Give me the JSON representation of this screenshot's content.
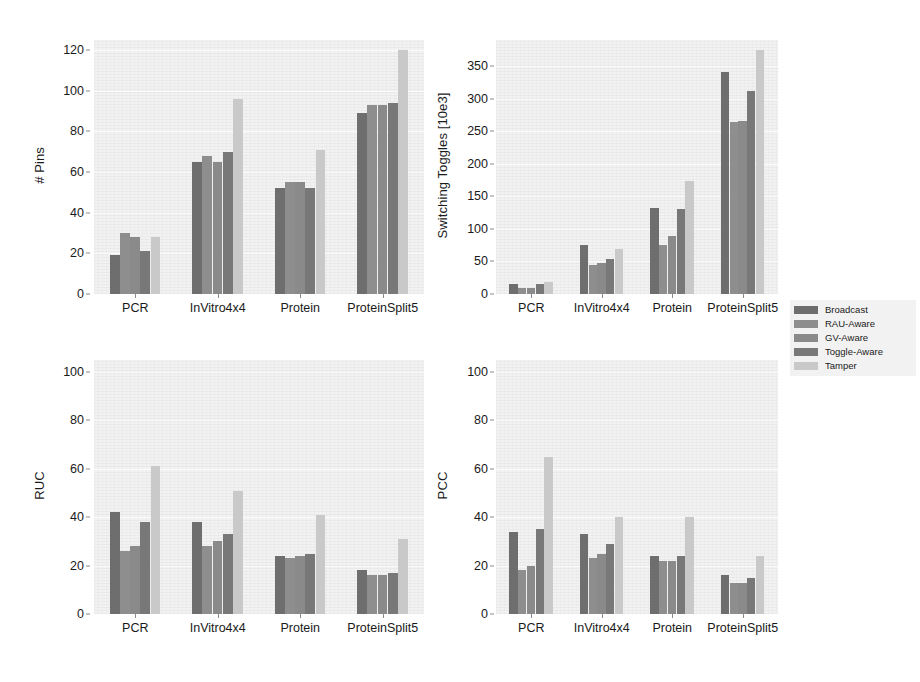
{
  "figure": {
    "background": "#ffffff",
    "plot_background": "#f2f2f2",
    "grid": true,
    "legend_position": "right-middle"
  },
  "series_colors": {
    "Broadcast": "#6e6e6e",
    "RAU-Aware": "#8e8e8e",
    "GV-Aware": "#8a8a8a",
    "Toggle-Aware": "#787878",
    "Tamper": "#c9c9c9"
  },
  "legend": {
    "entries": [
      {
        "label": "Broadcast",
        "color": "#6e6e6e"
      },
      {
        "label": "RAU-Aware",
        "color": "#8e8e8e"
      },
      {
        "label": "GV-Aware",
        "color": "#8a8a8a"
      },
      {
        "label": "Toggle-Aware",
        "color": "#787878"
      },
      {
        "label": "Tamper",
        "color": "#c9c9c9"
      }
    ]
  },
  "chart_data": [
    {
      "type": "bar",
      "title": "",
      "xlabel": "",
      "ylabel": "# Pins",
      "categories": [
        "PCR",
        "InVitro4x4",
        "Protein",
        "ProteinSplit5"
      ],
      "yticks": [
        0,
        20,
        40,
        60,
        80,
        100,
        120
      ],
      "ylim": [
        0,
        125
      ],
      "grid": true,
      "series": [
        {
          "name": "Broadcast",
          "values": [
            19,
            65,
            52,
            89
          ]
        },
        {
          "name": "RAU-Aware",
          "values": [
            30,
            68,
            55,
            93
          ]
        },
        {
          "name": "GV-Aware",
          "values": [
            28,
            65,
            55,
            93
          ]
        },
        {
          "name": "Toggle-Aware",
          "values": [
            21,
            70,
            52,
            94
          ]
        },
        {
          "name": "Tamper",
          "values": [
            28,
            96,
            71,
            120
          ]
        }
      ]
    },
    {
      "type": "bar",
      "title": "",
      "xlabel": "",
      "ylabel": "Switching Toggles [10e3]",
      "categories": [
        "PCR",
        "InVitro4x4",
        "Protein",
        "ProteinSplit5"
      ],
      "yticks": [
        0,
        50,
        100,
        150,
        200,
        250,
        300,
        350
      ],
      "ylim": [
        0,
        390
      ],
      "grid": true,
      "series": [
        {
          "name": "Broadcast",
          "values": [
            15,
            75,
            132,
            341
          ]
        },
        {
          "name": "RAU-Aware",
          "values": [
            9,
            45,
            75,
            264
          ]
        },
        {
          "name": "GV-Aware",
          "values": [
            10,
            48,
            89,
            265
          ]
        },
        {
          "name": "Toggle-Aware",
          "values": [
            15,
            54,
            131,
            311
          ]
        },
        {
          "name": "Tamper",
          "values": [
            18,
            69,
            173,
            374
          ]
        }
      ]
    },
    {
      "type": "bar",
      "title": "",
      "xlabel": "",
      "ylabel": "RUC",
      "categories": [
        "PCR",
        "InVitro4x4",
        "Protein",
        "ProteinSplit5"
      ],
      "yticks": [
        0,
        20,
        40,
        60,
        80,
        100
      ],
      "ylim": [
        0,
        105
      ],
      "grid": true,
      "series": [
        {
          "name": "Broadcast",
          "values": [
            42,
            38,
            24,
            18
          ]
        },
        {
          "name": "RAU-Aware",
          "values": [
            26,
            28,
            23,
            16
          ]
        },
        {
          "name": "GV-Aware",
          "values": [
            28,
            30,
            24,
            16
          ]
        },
        {
          "name": "Toggle-Aware",
          "values": [
            38,
            33,
            25,
            17
          ]
        },
        {
          "name": "Tamper",
          "values": [
            61,
            51,
            41,
            31
          ]
        }
      ]
    },
    {
      "type": "bar",
      "title": "",
      "xlabel": "",
      "ylabel": "PCC",
      "categories": [
        "PCR",
        "InVitro4x4",
        "Protein",
        "ProteinSplit5"
      ],
      "yticks": [
        0,
        20,
        40,
        60,
        80,
        100
      ],
      "ylim": [
        0,
        105
      ],
      "grid": true,
      "series": [
        {
          "name": "Broadcast",
          "values": [
            34,
            33,
            24,
            16
          ]
        },
        {
          "name": "RAU-Aware",
          "values": [
            18,
            23,
            22,
            13
          ]
        },
        {
          "name": "GV-Aware",
          "values": [
            20,
            25,
            22,
            13
          ]
        },
        {
          "name": "Toggle-Aware",
          "values": [
            35,
            29,
            24,
            15
          ]
        },
        {
          "name": "Tamper",
          "values": [
            65,
            40,
            40,
            24
          ]
        }
      ]
    }
  ]
}
